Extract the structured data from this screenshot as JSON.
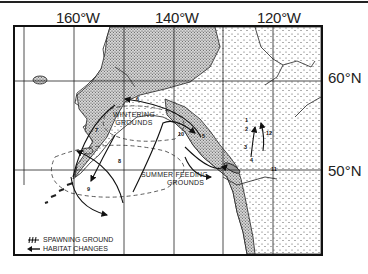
{
  "map": {
    "longitude_labels": [
      "160°W",
      "140°W",
      "120°W"
    ],
    "latitude_labels": [
      "60°N",
      "50°N"
    ],
    "region_labels": {
      "wintering": [
        "WINTERING",
        "GROUNDS"
      ],
      "summer_feeding": [
        "SUMMER FEEDING",
        "GROUNDS"
      ]
    },
    "route_numbers": [
      "1",
      "2",
      "3",
      "4",
      "5",
      "6",
      "7",
      "8",
      "9",
      "10",
      "11",
      "12"
    ],
    "legend": {
      "spawning_ground": "SPAWNING GROUND",
      "habitat_changes": "HABITAT CHANGES"
    },
    "colors": {
      "ink": "#1a1a1a",
      "land_stipple": "#555555",
      "ocean": "#ffffff"
    }
  }
}
